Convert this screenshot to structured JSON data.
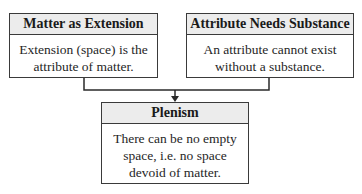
{
  "diagram": {
    "nodes": [
      {
        "id": "matter-as-extension",
        "title": "Matter as Extension",
        "body_lines": [
          "Extension (space) is the",
          "attribute of matter."
        ]
      },
      {
        "id": "attribute-needs-substance",
        "title": "Attribute Needs Substance",
        "body_lines": [
          "An attribute cannot exist",
          "without a substance."
        ]
      },
      {
        "id": "plenism",
        "title": "Plenism",
        "body_lines": [
          "There can be no empty",
          "space, i.e. no space",
          "devoid of matter."
        ]
      }
    ],
    "edges": [
      {
        "from": "matter-as-extension",
        "to": "plenism"
      },
      {
        "from": "attribute-needs-substance",
        "to": "plenism"
      }
    ],
    "colors": {
      "border": "#3a3a3a",
      "header_bg": "#ececec",
      "body_bg": "#ffffff"
    }
  }
}
